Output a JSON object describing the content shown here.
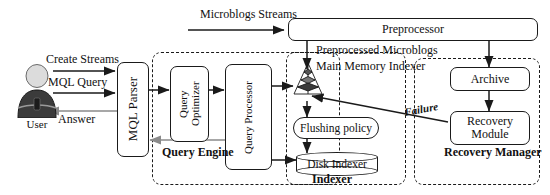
{
  "diagram": {
    "actor": {
      "name": "user-actor",
      "label": "User"
    },
    "edge_labels": {
      "create_streams": "Create Streams",
      "mql_query": "MQL Query",
      "answer": "Answer",
      "microblogs_streams": "Microblogs Streams",
      "preprocessed_microblogs": "Preprocessed Microblogs",
      "failure": "Failure"
    },
    "nodes": {
      "mql_parser": "MQL Parser",
      "query_optimizer": "Query Optimizer",
      "query_processor": "Query Processor",
      "preprocessor": "Preprocessor",
      "main_memory_indexer": "Main Memory Indexer",
      "flushing_policy": "Flushing policy",
      "disk_indexer": "Disk Indexer",
      "archive": "Archive",
      "recovery_module": "Recovery Module"
    },
    "groups": {
      "query_engine": "Query Engine",
      "indexer": "Indexer",
      "recovery_manager": "Recovery Manager"
    },
    "icons": {
      "user": "person-icon",
      "pyramid": "pyramid-index-icon",
      "disk": "database-cylinder-icon"
    },
    "colors": {
      "stroke": "#1a1a1a",
      "fill": "#ffffff",
      "answer_arrow": "#8a8a8a",
      "user_body": "#3b3b3b",
      "user_head": "#d8d8d8"
    }
  }
}
